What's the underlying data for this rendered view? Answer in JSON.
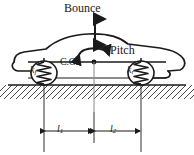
{
  "figure": {
    "type": "engineering-schematic",
    "background_color": "#ffffff",
    "line_color": "#1a1a1a"
  },
  "labels": {
    "bounce": "Bounce",
    "pitch": "Pitch",
    "center_of_gravity": "C.G.",
    "stiffness_front": "k",
    "stiffness_front_sub": "f",
    "stiffness_rear": "k",
    "stiffness_rear_sub": "r",
    "length_front": "l",
    "length_front_sub": "1",
    "length_rear": "l",
    "length_rear_sub": "2"
  },
  "motions": [
    {
      "name": "bounce",
      "label": "Bounce",
      "arrow": "vertical-double-arrow",
      "dof": "translation"
    },
    {
      "name": "pitch",
      "label": "Pitch",
      "arrow": "curved-double-arrow",
      "dof": "rotation"
    }
  ],
  "springs": [
    {
      "name": "front-spring",
      "label": "k",
      "subscript": "f",
      "coils": 6
    },
    {
      "name": "rear-spring",
      "label": "k",
      "subscript": "r",
      "coils": 6
    }
  ],
  "dimensions": [
    {
      "name": "l1",
      "label": "l",
      "subscript": "1",
      "from": "front-axle",
      "to": "center-of-gravity"
    },
    {
      "name": "l2",
      "label": "l",
      "subscript": "2",
      "from": "center-of-gravity",
      "to": "rear-axle"
    }
  ],
  "ground": {
    "name": "ground",
    "style": "hatched",
    "hatch_angle_deg": 45
  }
}
